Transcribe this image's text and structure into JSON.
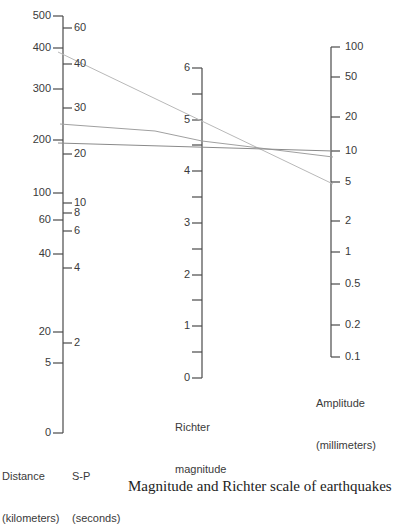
{
  "figure": {
    "type": "nomogram"
  },
  "chart_data": {
    "type": "nomogram",
    "axes": [
      {
        "name": "Distance",
        "title": "Distance\n(kilometers)",
        "ticks": [
          "500",
          "400",
          "300",
          "200",
          "100",
          "60",
          "40",
          "20",
          "5",
          "0"
        ]
      },
      {
        "name": "S-P",
        "title": "S-P\n(seconds)",
        "ticks": [
          "60",
          "40",
          "30",
          "20",
          "10",
          "8",
          "6",
          "4",
          "2"
        ]
      },
      {
        "name": "Richter magnitude",
        "title": "Richter\nmagnitude",
        "ticks": [
          "6",
          "5",
          "4",
          "3",
          "2",
          "1",
          "0"
        ],
        "range": [
          0,
          6
        ]
      },
      {
        "name": "Amplitude",
        "title": "Amplitude\n(millimeters)",
        "ticks": [
          "100",
          "50",
          "20",
          "10",
          "5",
          "2",
          "1",
          "0.5",
          "0.2",
          "0.1"
        ]
      }
    ],
    "lines": [
      {
        "name": "line-a",
        "from_distance_km": 380,
        "through_magnitude": 5.0,
        "to_amplitude_mm": 5
      },
      {
        "name": "line-b",
        "from_distance_km": 230,
        "through_magnitude": 4.7,
        "to_amplitude_mm": 9
      },
      {
        "name": "line-c",
        "from_distance_km": 195,
        "through_magnitude": 4.6,
        "to_amplitude_mm": 10
      }
    ]
  },
  "labels": {
    "distance_title_1": "Distance",
    "distance_title_2": "(kilometers)",
    "sp_title_1": "S-P",
    "sp_title_2": "(seconds)",
    "richter_title_1": "Richter",
    "richter_title_2": "magnitude",
    "amplitude_title_1": "Amplitude",
    "amplitude_title_2": "(millimeters)"
  },
  "distance_ticks": [
    {
      "label": "500",
      "y": 16
    },
    {
      "label": "400",
      "y": 48
    },
    {
      "label": "300",
      "y": 89
    },
    {
      "label": "200",
      "y": 140
    },
    {
      "label": "100",
      "y": 193
    },
    {
      "label": "60",
      "y": 220
    },
    {
      "label": "40",
      "y": 254
    },
    {
      "label": "20",
      "y": 332
    },
    {
      "label": "5",
      "y": 363
    },
    {
      "label": "0",
      "y": 433
    }
  ],
  "sp_ticks": [
    {
      "label": "60",
      "y": 28
    },
    {
      "label": "40",
      "y": 64
    },
    {
      "label": "30",
      "y": 108
    },
    {
      "label": "20",
      "y": 154
    },
    {
      "label": "10",
      "y": 203
    },
    {
      "label": "8",
      "y": 213
    },
    {
      "label": "6",
      "y": 231
    },
    {
      "label": "4",
      "y": 268
    },
    {
      "label": "2",
      "y": 343
    }
  ],
  "richter_ticks": [
    {
      "label": "6",
      "y": 68
    },
    {
      "label": "5",
      "y": 120
    },
    {
      "label": "4",
      "y": 171
    },
    {
      "label": "3",
      "y": 223
    },
    {
      "label": "2",
      "y": 275
    },
    {
      "label": "1",
      "y": 326
    },
    {
      "label": "0",
      "y": 378
    }
  ],
  "amplitude_ticks": [
    {
      "label": "100",
      "y": 47
    },
    {
      "label": "50",
      "y": 77
    },
    {
      "label": "20",
      "y": 117
    },
    {
      "label": "10",
      "y": 151
    },
    {
      "label": "5",
      "y": 182
    },
    {
      "label": "2",
      "y": 221
    },
    {
      "label": "1",
      "y": 252
    },
    {
      "label": "0.5",
      "y": 284
    },
    {
      "label": "0.2",
      "y": 325
    },
    {
      "label": "0.1",
      "y": 357
    }
  ],
  "caption_clipped": "Magnitude and Richter scale of earthquakes"
}
